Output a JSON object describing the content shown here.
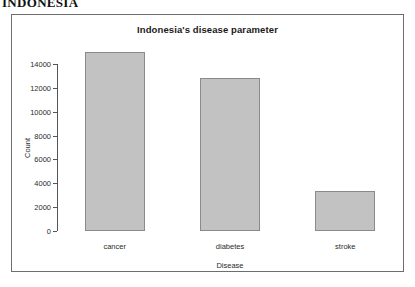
{
  "document": {
    "heading": "INDONESIA"
  },
  "chart_data": {
    "type": "bar",
    "title": "Indonesia's disease parameter",
    "xlabel": "Disease",
    "ylabel": "Count",
    "categories": [
      "cancer",
      "diabetes",
      "stroke"
    ],
    "values": [
      15000,
      12800,
      3350
    ],
    "ylim": [
      0,
      14000
    ],
    "yticks": [
      0,
      2000,
      4000,
      6000,
      8000,
      10000,
      12000,
      14000
    ],
    "ytick_labels": [
      "0",
      "2000",
      "4000",
      "6000",
      "8000",
      "10000",
      "12000",
      "14000"
    ],
    "grid": false,
    "legend": false,
    "bar_color": "#c2c2c2",
    "bar_border_color": "#8a8a8a",
    "frame_border_color": "#6e6e6e"
  }
}
